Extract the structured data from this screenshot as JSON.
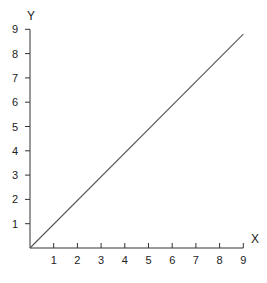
{
  "chart_data": {
    "type": "line",
    "title": "",
    "xlabel": "X",
    "ylabel": "Y",
    "xlim": [
      0,
      9
    ],
    "ylim": [
      0,
      9
    ],
    "grid": false,
    "legend": null,
    "x_ticks": [
      1,
      2,
      3,
      4,
      5,
      6,
      7,
      8,
      9
    ],
    "y_ticks": [
      1,
      2,
      3,
      4,
      5,
      6,
      7,
      8,
      9
    ],
    "series": [
      {
        "name": "line",
        "x": [
          0,
          9
        ],
        "y": [
          0,
          8.8
        ],
        "color": "#555555"
      }
    ]
  },
  "colors": {
    "axis": "#333333",
    "line": "#555555",
    "text": "#222222"
  }
}
